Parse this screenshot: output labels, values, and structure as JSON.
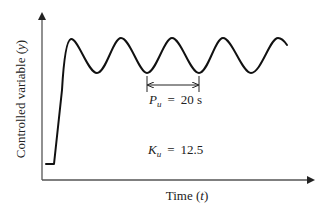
{
  "figure": {
    "y_axis_label_prefix": "Controlled variable",
    "y_axis_label_var": "y",
    "x_axis_label_prefix": "Time",
    "x_axis_label_var": "t",
    "period_symbol": "P",
    "period_subscript": "u",
    "period_equals": "=",
    "period_value": "20 s",
    "gain_symbol": "K",
    "gain_subscript": "u",
    "gain_equals": "=",
    "gain_value": "12.5"
  },
  "colors": {
    "curve": "#111111",
    "axis": "#555555",
    "text": "#222222"
  }
}
